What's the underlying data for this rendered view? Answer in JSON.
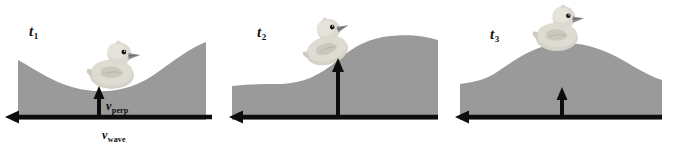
{
  "figure": {
    "colors": {
      "water": "#9a9a9a",
      "water_edge": "#8f8f8f",
      "background": "#ffffff",
      "arrow": "#0d0d0d",
      "duck_body": "#d6d2c8",
      "duck_shadow": "#bdb8ad",
      "duck_highlight": "#e8e5dd",
      "duck_beak": "#8c8c8c",
      "duck_eye": "#101010",
      "label_text": "#121212"
    }
  },
  "panels": [
    {
      "id": "panel-1",
      "time_label": "t",
      "time_subscript": "1",
      "wave_phase": "trough",
      "duck_position": "bottom of trough",
      "vectors": {
        "perpendicular": {
          "symbol": "v",
          "subscript": "perp",
          "direction": "up",
          "length_px": 27
        },
        "wave": {
          "symbol": "v",
          "subscript": "wave",
          "direction": "left",
          "length_px": 210
        }
      }
    },
    {
      "id": "panel-2",
      "time_label": "t",
      "time_subscript": "2",
      "wave_phase": "rising slope",
      "duck_position": "on rising slope",
      "vectors": {
        "perpendicular": {
          "symbol": "v",
          "subscript": "perp",
          "direction": "up",
          "length_px": 56
        },
        "wave": {
          "symbol": "v",
          "subscript": "wave",
          "direction": "left",
          "length_px": 210
        }
      }
    },
    {
      "id": "panel-3",
      "time_label": "t",
      "time_subscript": "3",
      "wave_phase": "crest",
      "duck_position": "top of crest",
      "vectors": {
        "perpendicular": {
          "symbol": "v",
          "subscript": "perp",
          "direction": "up",
          "length_px": 26
        },
        "wave": {
          "symbol": "v",
          "subscript": "wave",
          "direction": "left",
          "length_px": 210
        }
      }
    }
  ]
}
